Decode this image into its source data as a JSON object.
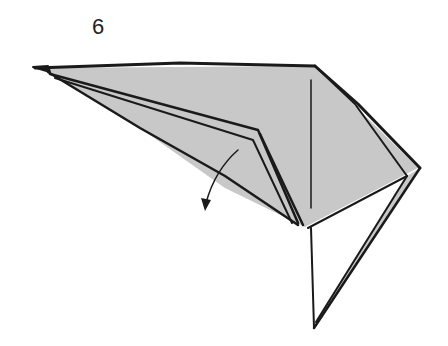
{
  "step": {
    "number": "6"
  },
  "diagram": {
    "paper_color": "#c8c8c8",
    "line_color": "#1a1a1a",
    "annotations": [
      {
        "type": "fold-arrow",
        "direction": "down-left"
      }
    ]
  }
}
